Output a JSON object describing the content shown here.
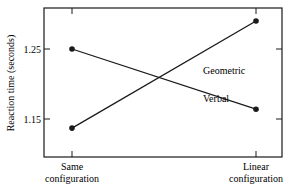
{
  "chart_data": {
    "type": "line",
    "title": "",
    "xlabel": "",
    "ylabel": "Reaction time (seconds)",
    "categories": [
      "Same configuration",
      "Linear configuration"
    ],
    "category_lines": [
      [
        "Same",
        "configuration"
      ],
      [
        "Linear",
        "configuration"
      ]
    ],
    "series": [
      {
        "name": "Geometric",
        "values": [
          1.137,
          1.29
        ]
      },
      {
        "name": "Verbal",
        "values": [
          1.25,
          1.164
        ]
      }
    ],
    "yticks": [
      1.15,
      1.25
    ],
    "ytick_labels": [
      "1.15",
      "1.25"
    ],
    "ylim": [
      1.097,
      1.305
    ],
    "grid": false,
    "legend": "inline labels on lines"
  }
}
